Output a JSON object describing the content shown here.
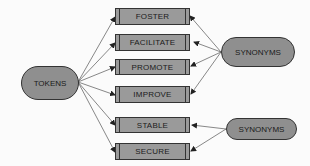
{
  "diagram": {
    "source_node": {
      "label": "TOKENS"
    },
    "target_nodes": [
      {
        "label": "FOSTER"
      },
      {
        "label": "FACILITATE"
      },
      {
        "label": "PROMOTE"
      },
      {
        "label": "IMPROVE"
      },
      {
        "label": "STABLE"
      },
      {
        "label": "SECURE"
      }
    ],
    "synonym_groups": [
      {
        "label": "SYNONYMS",
        "members": [
          "FOSTER",
          "FACILITATE",
          "PROMOTE",
          "IMPROVE"
        ]
      },
      {
        "label": "SYNONYMS",
        "members": [
          "STABLE",
          "SECURE"
        ]
      }
    ],
    "edges": [
      {
        "from": "TOKENS",
        "to": "FOSTER"
      },
      {
        "from": "TOKENS",
        "to": "FACILITATE"
      },
      {
        "from": "TOKENS",
        "to": "PROMOTE"
      },
      {
        "from": "TOKENS",
        "to": "IMPROVE"
      },
      {
        "from": "TOKENS",
        "to": "STABLE"
      },
      {
        "from": "TOKENS",
        "to": "SECURE"
      },
      {
        "from": "SYNONYMS",
        "to": "FOSTER"
      },
      {
        "from": "SYNONYMS",
        "to": "FACILITATE"
      },
      {
        "from": "SYNONYMS",
        "to": "PROMOTE"
      },
      {
        "from": "SYNONYMS",
        "to": "IMPROVE"
      },
      {
        "from": "SYNONYMS",
        "to": "STABLE"
      },
      {
        "from": "SYNONYMS",
        "to": "SECURE"
      }
    ]
  },
  "colors": {
    "node_fill": "#9a9a9a",
    "pill_fill": "#8f8f8f",
    "stroke": "#333333",
    "background": "#fbfbfb"
  }
}
